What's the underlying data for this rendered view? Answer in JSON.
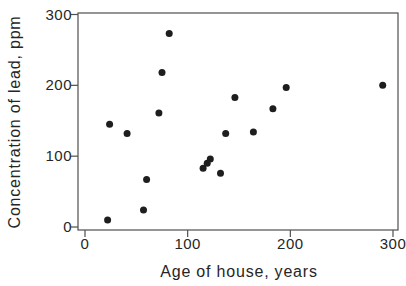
{
  "figure": {
    "background": "#ffffff"
  },
  "chart_data": {
    "type": "scatter",
    "xlabel": "Age of house, years",
    "ylabel": "Concentration of lead, ppm",
    "xlim": [
      0,
      300
    ],
    "ylim": [
      0,
      300
    ],
    "x_ticks": [
      "0",
      "100",
      "200",
      "300"
    ],
    "y_ticks": [
      "0",
      "100",
      "200",
      "300"
    ],
    "x_tick_values": [
      0,
      100,
      200,
      300
    ],
    "y_tick_values": [
      0,
      100,
      200,
      300
    ],
    "grid": false,
    "legend": false,
    "marker": {
      "shape": "circle",
      "color": "#1e1e1e",
      "diameter_px": 7
    },
    "axis_color": "#4f4f4f",
    "text_color": "#262626",
    "points": [
      {
        "x": 22,
        "y": 10
      },
      {
        "x": 24,
        "y": 145
      },
      {
        "x": 41,
        "y": 132
      },
      {
        "x": 57,
        "y": 24
      },
      {
        "x": 60,
        "y": 67
      },
      {
        "x": 72,
        "y": 161
      },
      {
        "x": 75,
        "y": 218
      },
      {
        "x": 82,
        "y": 273
      },
      {
        "x": 115,
        "y": 83
      },
      {
        "x": 119,
        "y": 90
      },
      {
        "x": 122,
        "y": 96
      },
      {
        "x": 132,
        "y": 76
      },
      {
        "x": 137,
        "y": 132
      },
      {
        "x": 146,
        "y": 183
      },
      {
        "x": 164,
        "y": 134
      },
      {
        "x": 183,
        "y": 167
      },
      {
        "x": 196,
        "y": 197
      },
      {
        "x": 290,
        "y": 200
      }
    ]
  }
}
